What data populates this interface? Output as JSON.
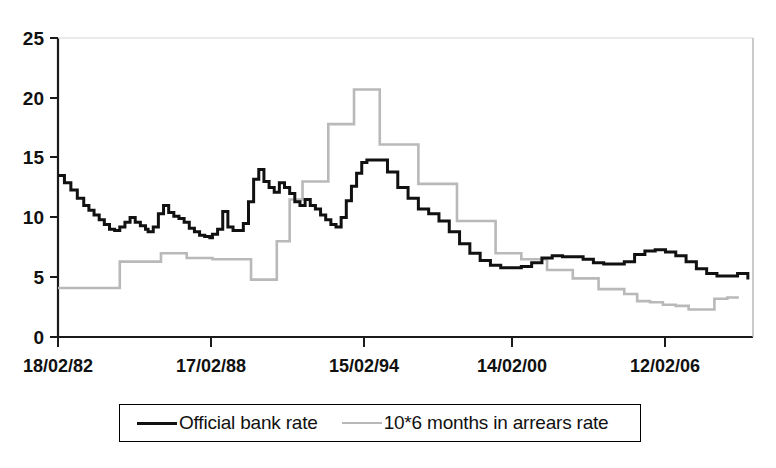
{
  "figure": {
    "name": "uk-official-bank-rate-vs-arrears-chart",
    "cropped_title": "",
    "background": "#ffffff"
  },
  "chart_data": {
    "type": "line",
    "title": "",
    "subtitle": "",
    "xlabel": "",
    "ylabel": "",
    "grid": false,
    "legend_position": "bottom",
    "ylim": [
      0,
      25
    ],
    "yticks": [
      0,
      5,
      10,
      15,
      20,
      25
    ],
    "ytick_labels": [
      "0",
      "5",
      "10",
      "15",
      "20",
      "25"
    ],
    "xticks": [
      0,
      6,
      12,
      18,
      24
    ],
    "xtick_labels": [
      "18/02/82",
      "17/02/88",
      "15/02/94",
      "14/02/00",
      "12/02/06"
    ],
    "xlim": [
      0,
      27
    ],
    "x_unit": "years since 18/02/82",
    "series": [
      {
        "name": "Official bank rate",
        "color": "#111111",
        "style": "step",
        "x": [
          0.0,
          0.25,
          0.5,
          0.75,
          1.0,
          1.2,
          1.4,
          1.6,
          1.8,
          2.0,
          2.2,
          2.4,
          2.6,
          2.8,
          3.0,
          3.2,
          3.4,
          3.5,
          3.7,
          3.9,
          4.1,
          4.3,
          4.5,
          4.7,
          4.9,
          5.1,
          5.3,
          5.5,
          5.7,
          5.9,
          6.0,
          6.2,
          6.4,
          6.6,
          6.8,
          7.0,
          7.2,
          7.4,
          7.6,
          7.8,
          8.0,
          8.2,
          8.4,
          8.6,
          8.8,
          9.0,
          9.2,
          9.4,
          9.6,
          9.8,
          10.0,
          10.2,
          10.4,
          10.6,
          10.8,
          11.0,
          11.2,
          11.4,
          11.6,
          11.8,
          12.0,
          12.4,
          12.8,
          13.2,
          13.6,
          14.0,
          14.4,
          14.8,
          15.2,
          15.6,
          16.0,
          16.4,
          16.8,
          17.2,
          17.6,
          18.0,
          18.4,
          18.8,
          19.2,
          19.6,
          20.0,
          20.4,
          20.8,
          21.2,
          21.6,
          22.0,
          22.4,
          22.8,
          23.2,
          23.6,
          24.0,
          24.4,
          24.8,
          25.2,
          25.6,
          26.0,
          26.4
        ],
        "y": [
          13.5,
          12.9,
          12.3,
          11.6,
          11.0,
          10.6,
          10.2,
          9.8,
          9.4,
          9.0,
          8.9,
          9.2,
          9.6,
          10.0,
          9.6,
          9.3,
          9.0,
          8.8,
          9.2,
          10.3,
          11.0,
          10.4,
          10.1,
          9.9,
          9.6,
          9.1,
          8.8,
          8.5,
          8.4,
          8.3,
          8.6,
          9.0,
          10.5,
          9.2,
          8.9,
          8.9,
          9.5,
          11.3,
          13.2,
          14.0,
          13.0,
          12.5,
          12.1,
          12.9,
          12.5,
          12.0,
          11.3,
          11.0,
          11.5,
          11.0,
          10.7,
          10.2,
          9.8,
          9.4,
          9.2,
          10.0,
          11.4,
          12.6,
          13.7,
          14.6,
          14.8,
          14.8,
          13.8,
          12.5,
          11.6,
          10.7,
          10.3,
          9.7,
          8.8,
          7.8,
          7.0,
          6.4,
          6.0,
          5.8,
          5.8,
          5.9,
          6.2,
          6.6,
          6.8,
          6.7,
          6.7,
          6.5,
          6.2,
          6.1,
          6.1,
          6.3,
          6.9,
          7.2,
          7.3,
          7.1,
          6.8,
          6.3,
          5.7,
          5.3,
          5.1,
          5.1,
          5.3
        ],
        "y_tail": [
          4.8,
          4.3,
          4.0,
          3.8,
          3.8,
          3.9,
          4.2,
          4.5,
          4.7,
          4.7,
          4.6,
          4.8,
          5.2,
          5.5,
          5.7,
          5.5,
          5.3
        ]
      },
      {
        "name": "10*6 months in arrears rate",
        "color": "#b9b9b9",
        "style": "step",
        "x": [
          0.0,
          1.0,
          2.0,
          2.4,
          3.0,
          4.0,
          4.5,
          5.0,
          5.5,
          6.0,
          6.5,
          7.0,
          7.5,
          8.0,
          8.5,
          9.0,
          9.5,
          10.0,
          10.5,
          11.0,
          11.5,
          12.0,
          12.5,
          13.0,
          13.5,
          14.0,
          14.5,
          15.0,
          15.5,
          16.0,
          16.5,
          17.0,
          17.5,
          18.0,
          18.5,
          19.0,
          19.5,
          20.0,
          20.5,
          21.0,
          21.5,
          22.0,
          22.5,
          23.0,
          23.5,
          24.0,
          24.5,
          25.0,
          25.5,
          26.0,
          26.4
        ],
        "y": [
          4.1,
          4.1,
          4.1,
          6.3,
          6.3,
          7.0,
          7.0,
          6.6,
          6.6,
          6.5,
          6.5,
          6.5,
          4.8,
          4.8,
          8.0,
          11.5,
          13.0,
          13.0,
          17.8,
          17.8,
          20.7,
          20.7,
          16.1,
          16.1,
          16.1,
          12.8,
          12.8,
          12.8,
          9.7,
          9.7,
          9.7,
          7.0,
          7.0,
          6.5,
          6.5,
          5.6,
          5.6,
          4.9,
          4.9,
          4.0,
          4.0,
          3.6,
          3.0,
          2.9,
          2.7,
          2.6,
          2.3,
          2.3,
          3.2,
          3.3,
          3.4
        ],
        "note": "arrears rate scaled by factor 10"
      }
    ]
  },
  "legend": {
    "items": [
      {
        "label": "Official bank rate",
        "color": "#111111",
        "swatch": "solid-line"
      },
      {
        "label": "10*6 months in arrears rate",
        "color": "#b9b9b9",
        "swatch": "solid-line"
      }
    ]
  },
  "axes": {
    "y_tick_labels": [
      "25",
      "20",
      "15",
      "10",
      "5",
      "0"
    ],
    "x_tick_labels": [
      "18/02/82",
      "17/02/88",
      "15/02/94",
      "14/02/00",
      "12/02/06"
    ]
  }
}
